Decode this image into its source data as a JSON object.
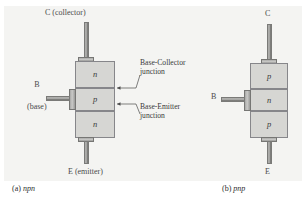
{
  "figure": {
    "background_color": "#f4f4f2",
    "layer_fill": "#d6d6d3",
    "layer_border": "#86868a",
    "metal_color": "#a8a8a6"
  },
  "npn": {
    "caption_prefix": "(a) ",
    "caption_type": "npn",
    "collector_label": "C (collector)",
    "emitter_label": "E (emitter)",
    "base_label": "B",
    "base_sublabel": "(base)",
    "layers": [
      {
        "type": "n"
      },
      {
        "type": "p"
      },
      {
        "type": "n"
      }
    ],
    "callouts": [
      {
        "line1": "Base-Collector",
        "line2": "junction"
      },
      {
        "line1": "Base-Emitter",
        "line2": "junction"
      }
    ]
  },
  "pnp": {
    "caption_prefix": "(b) ",
    "caption_type": "pnp",
    "collector_label": "C",
    "emitter_label": "E",
    "base_label": "B",
    "layers": [
      {
        "type": "p"
      },
      {
        "type": "n"
      },
      {
        "type": "p"
      }
    ]
  }
}
